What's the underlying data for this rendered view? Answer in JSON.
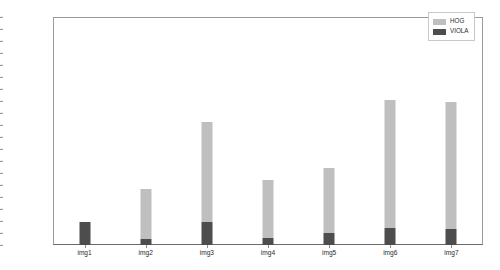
{
  "chart_data": {
    "type": "bar",
    "stacked": true,
    "title": "",
    "xlabel": "",
    "ylabel": "",
    "categories": [
      "img1",
      "img2",
      "img3",
      "img4",
      "img5",
      "img6",
      "img7"
    ],
    "series": [
      {
        "name": "VIOLA",
        "color": "#4d4d4d",
        "values": [
          330,
          80,
          330,
          100,
          170,
          250,
          230
        ]
      },
      {
        "name": "HOG",
        "color": "#bfbfbf",
        "values": [
          0,
          730,
          1450,
          840,
          940,
          1840,
          1840
        ]
      }
    ],
    "totals": [
      330,
      810,
      1780,
      940,
      1110,
      2090,
      2070
    ],
    "ylim": [
      0,
      3292
    ],
    "yticks": [
      0,
      173,
      346,
      520,
      693,
      866,
      1040,
      1213,
      1386,
      1559,
      1732,
      1906,
      2079,
      2252,
      2426,
      2599,
      2772,
      2945,
      3118,
      3292
    ],
    "ytick_labels": [
      "0",
      "173",
      "346",
      "520",
      "693",
      "866",
      "1040",
      "1213",
      "1386",
      "1559",
      "1732",
      "1906",
      "2079",
      "2252",
      "2426",
      "2599",
      "2772",
      "2945",
      "3118",
      "3292"
    ],
    "grid": false,
    "legend_position": "top-right",
    "legend_entries": [
      {
        "label": "HOG",
        "color": "#bfbfbf"
      },
      {
        "label": "VIOLA",
        "color": "#4d4d4d"
      }
    ]
  }
}
